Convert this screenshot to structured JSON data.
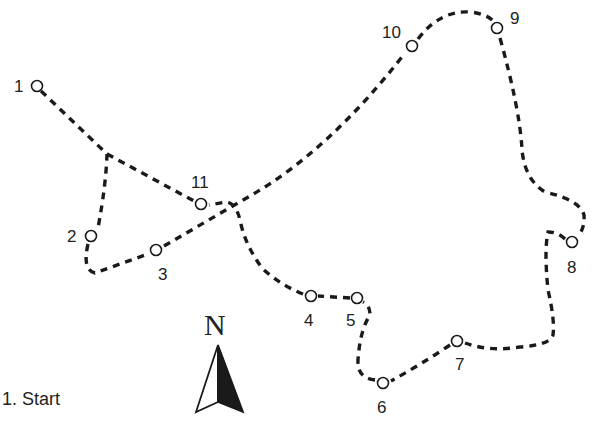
{
  "map": {
    "type": "orienteering-route",
    "waypoints": [
      {
        "id": 1,
        "label": "1",
        "x": 37,
        "y": 86
      },
      {
        "id": 2,
        "label": "2",
        "x": 91,
        "y": 236
      },
      {
        "id": 3,
        "label": "3",
        "x": 156,
        "y": 250
      },
      {
        "id": 4,
        "label": "4",
        "x": 311,
        "y": 296
      },
      {
        "id": 5,
        "label": "5",
        "x": 357,
        "y": 298
      },
      {
        "id": 6,
        "label": "6",
        "x": 383,
        "y": 383
      },
      {
        "id": 7,
        "label": "7",
        "x": 457,
        "y": 341
      },
      {
        "id": 8,
        "label": "8",
        "x": 572,
        "y": 242
      },
      {
        "id": 9,
        "label": "9",
        "x": 497,
        "y": 28
      },
      {
        "id": 10,
        "label": "10",
        "x": 412,
        "y": 46
      },
      {
        "id": 11,
        "label": "11",
        "x": 201,
        "y": 204
      }
    ],
    "compass": {
      "label": "N"
    },
    "legend": {
      "items": [
        "1. Start"
      ]
    },
    "colors": {
      "line": "#1a1a1a",
      "background": "#ffffff"
    }
  }
}
